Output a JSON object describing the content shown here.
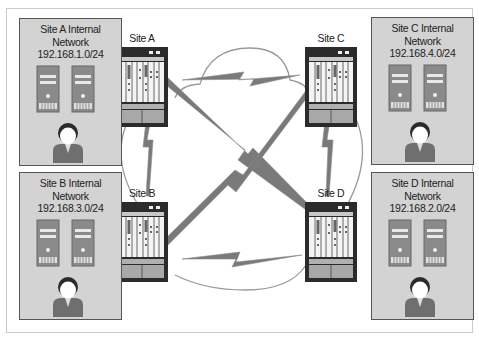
{
  "diagram": {
    "colors": {
      "site_box_fill": "#d3d3d3",
      "site_box_border": "#555555",
      "router_body": "#2b2b2b",
      "router_panel": "#f0f0f0",
      "link_bolt": "#7a7a7a",
      "cloud_outline": "#9a9a9a",
      "server_fill": "#8a8a8a",
      "user_body": "#6f6f6f"
    },
    "sites": [
      {
        "id": "A",
        "network_title": "Site A Internal",
        "network_word": "Network",
        "subnet": "192.168.1.0/24",
        "router_label": "Site A"
      },
      {
        "id": "B",
        "network_title": "Site B Internal",
        "network_word": "Network",
        "subnet": "192.168.3.0/24",
        "router_label": "Site B"
      },
      {
        "id": "C",
        "network_title": "Site C Internal",
        "network_word": "Network",
        "subnet": "192.168.4.0/24",
        "router_label": "Site C"
      },
      {
        "id": "D",
        "network_title": "Site D Internal",
        "network_word": "Network",
        "subnet": "192.168.2.0/24",
        "router_label": "Site D"
      }
    ],
    "links": [
      {
        "from": "Site A",
        "to": "Site C",
        "type": "wan-lightning"
      },
      {
        "from": "Site B",
        "to": "Site D",
        "type": "wan-lightning"
      },
      {
        "from": "Site A",
        "to": "Site B",
        "type": "wan-lightning"
      },
      {
        "from": "Site C",
        "to": "Site D",
        "type": "wan-lightning"
      },
      {
        "from": "Site A",
        "to": "Site D",
        "type": "wan-lightning"
      },
      {
        "from": "Site B",
        "to": "Site C",
        "type": "wan-lightning"
      }
    ]
  }
}
